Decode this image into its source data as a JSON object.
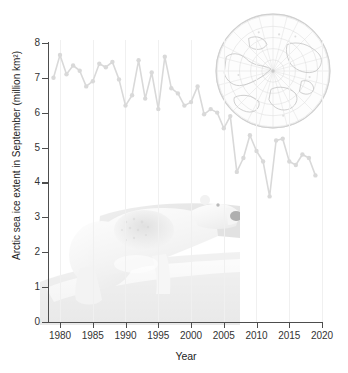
{
  "chart_data": {
    "type": "line",
    "title": "",
    "xlabel": "Year",
    "ylabel": "Arctic sea ice extent in September (million km²)",
    "xlim": [
      1978,
      2020
    ],
    "ylim": [
      0,
      8
    ],
    "xticks": [
      1980,
      1985,
      1990,
      1995,
      2000,
      2005,
      2010,
      2015,
      2020
    ],
    "yticks": [
      0,
      1,
      2,
      3,
      4,
      5,
      6,
      7,
      8
    ],
    "grid": "vertical-only",
    "legend": "none",
    "marker": "circle",
    "series_color": "#d9d9d9",
    "x": [
      1979,
      1980,
      1981,
      1982,
      1983,
      1984,
      1985,
      1986,
      1987,
      1988,
      1989,
      1990,
      1991,
      1992,
      1993,
      1994,
      1995,
      1996,
      1997,
      1998,
      1999,
      2000,
      2001,
      2002,
      2003,
      2004,
      2005,
      2006,
      2007,
      2008,
      2009,
      2010,
      2011,
      2012,
      2013,
      2014,
      2015,
      2016,
      2017,
      2018,
      2019
    ],
    "values": [
      7.0,
      7.65,
      7.1,
      7.35,
      7.2,
      6.75,
      6.9,
      7.4,
      7.3,
      7.45,
      6.95,
      6.2,
      6.5,
      7.5,
      6.4,
      7.15,
      6.1,
      7.6,
      6.7,
      6.55,
      6.2,
      6.3,
      6.75,
      5.95,
      6.1,
      6.0,
      5.55,
      5.9,
      4.3,
      4.7,
      5.35,
      4.9,
      4.6,
      3.6,
      5.2,
      5.25,
      4.6,
      4.5,
      4.8,
      4.7,
      4.2
    ],
    "annotations": [
      {
        "kind": "background-photo",
        "label": "polar bear on sea ice"
      },
      {
        "kind": "background-map",
        "label": "Arctic polar stereographic map"
      }
    ]
  },
  "figure": {
    "ylabel_text": "Arctic sea ice extent in September (million km²)",
    "xlabel_text": "Year"
  }
}
